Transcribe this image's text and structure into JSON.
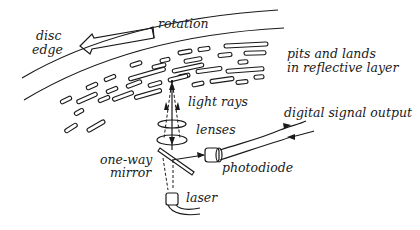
{
  "diagram": {
    "type": "CD optical pickup schematic",
    "labels": {
      "disc_edge_line1": "disc",
      "disc_edge_line2": "edge",
      "rotation": "rotation",
      "pits_line1": "pits and lands",
      "pits_line2": "in reflective layer",
      "light_rays": "light rays",
      "lenses": "lenses",
      "digital_output": "digital signal output",
      "mirror_line1": "one-way",
      "mirror_line2": "mirror",
      "photodiode": "photodiode",
      "laser": "laser"
    },
    "colors": {
      "ink": "#1a1a1a",
      "background": "#ffffff"
    }
  }
}
